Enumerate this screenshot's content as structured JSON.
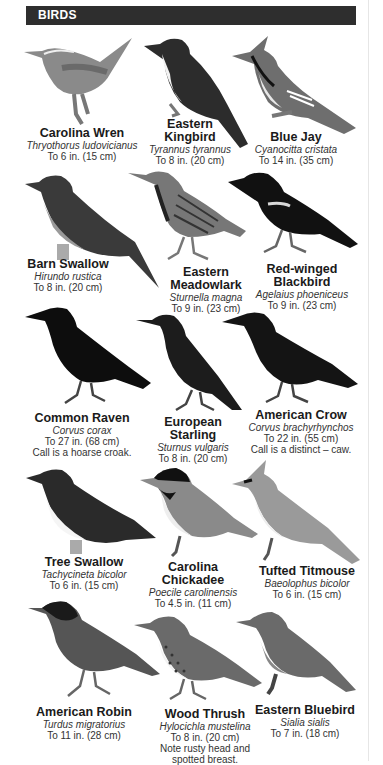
{
  "header": {
    "title": "BIRDS"
  },
  "birds": [
    {
      "name": "Carolina Wren",
      "scientific": "Thryothorus ludovicianus",
      "size": "To 6 in. (15 cm)",
      "icon": "carolina-wren-illustration"
    },
    {
      "name": "Eastern Kingbird",
      "scientific": "Tyrannus tyrannus",
      "size": "To 8 in. (20 cm)",
      "icon": "eastern-kingbird-illustration"
    },
    {
      "name": "Blue Jay",
      "scientific": "Cyanocitta cristata",
      "size": "To 14 in. (35 cm)",
      "icon": "blue-jay-illustration"
    },
    {
      "name": "Barn Swallow",
      "scientific": "Hirundo rustica",
      "size": "To 8 in. (20 cm)",
      "icon": "barn-swallow-illustration"
    },
    {
      "name": "Eastern Meadowlark",
      "scientific": "Sturnella magna",
      "size": "To 9 in. (23 cm)",
      "icon": "eastern-meadowlark-illustration"
    },
    {
      "name": "Red-winged Blackbird",
      "scientific": "Agelaius phoeniceus",
      "size": "To 9 in. (23 cm)",
      "icon": "red-winged-blackbird-illustration"
    },
    {
      "name": "Common Raven",
      "scientific": "Corvus corax",
      "size": "To 27 in. (68 cm)",
      "note": "Call is a hoarse croak.",
      "icon": "common-raven-illustration"
    },
    {
      "name": "European Starling",
      "scientific": "Sturnus vulgaris",
      "size": "To 8 in. (20 cm)",
      "icon": "european-starling-illustration"
    },
    {
      "name": "American Crow",
      "scientific": "Corvus brachyrhynchos",
      "size": "To 22 in. (55 cm)",
      "note": "Call is a distinct – caw.",
      "icon": "american-crow-illustration"
    },
    {
      "name": "Tree Swallow",
      "scientific": "Tachycineta bicolor",
      "size": "To 6 in. (15 cm)",
      "icon": "tree-swallow-illustration"
    },
    {
      "name": "Carolina Chickadee",
      "scientific": "Poecile carolinensis",
      "size": "To 4.5 in. (11 cm)",
      "icon": "carolina-chickadee-illustration"
    },
    {
      "name": "Tufted Titmouse",
      "scientific": "Baeolophus bicolor",
      "size": "To 6 in. (15 cm)",
      "icon": "tufted-titmouse-illustration"
    },
    {
      "name": "American Robin",
      "scientific": "Turdus migratorius",
      "size": "To 11 in. (28 cm)",
      "icon": "american-robin-illustration"
    },
    {
      "name": "Wood Thrush",
      "scientific": "Hylocichla mustelina",
      "size": "To 8 in. (20 cm)",
      "note": "Note rusty head and spotted breast.",
      "icon": "wood-thrush-illustration"
    },
    {
      "name": "Eastern Bluebird",
      "scientific": "Sialia sialis",
      "size": "To 7 in. (18 cm)",
      "icon": "eastern-bluebird-illustration"
    }
  ],
  "name_lines": {
    "eastern_kingbird": [
      "Eastern",
      "Kingbird"
    ],
    "eastern_meadowlark": [
      "Eastern",
      "Meadowlark"
    ],
    "red_winged_blackbird": [
      "Red-winged",
      "Blackbird"
    ],
    "european_starling": [
      "European",
      "Starling"
    ],
    "carolina_chickadee": [
      "Carolina",
      "Chickadee"
    ]
  },
  "note_lines": {
    "wood_thrush": [
      "Note rusty head and",
      "spotted breast."
    ]
  }
}
